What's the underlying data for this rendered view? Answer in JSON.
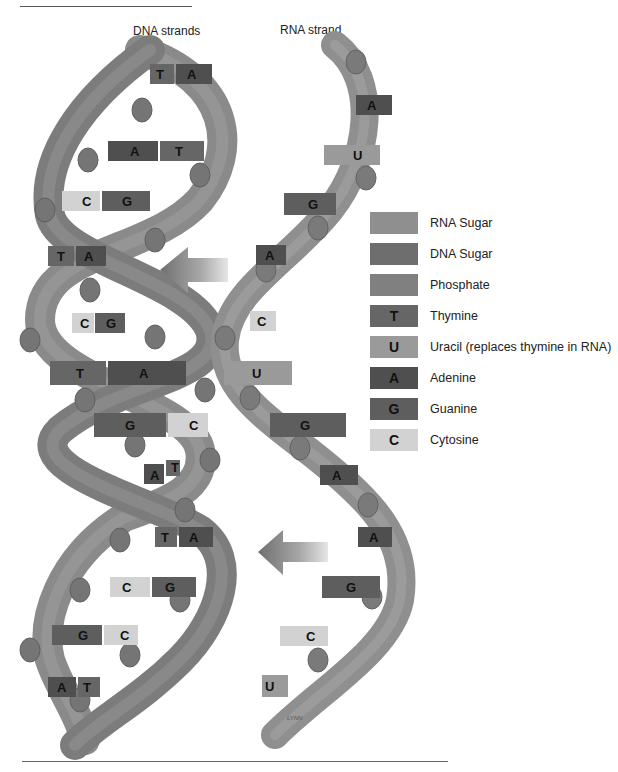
{
  "page": {
    "headings": {
      "dna": "DNA strands",
      "rna": "RNA strand"
    },
    "credit": "LYNN"
  },
  "colors": {
    "rna_sugar": "#8f8f8f",
    "dna_sugar": "#6e6e6e",
    "phosphate": "#7f7f7f",
    "thymine": "#666666",
    "uracil": "#9a9a9a",
    "adenine": "#4f4f4f",
    "guanine": "#5e5e5e",
    "cytosine": "#cfcfcf",
    "backbone": "#8a8a8a",
    "joint": "#777777"
  },
  "legend": [
    {
      "symbol": "",
      "label": "RNA Sugar",
      "color": "#8f8f8f"
    },
    {
      "symbol": "",
      "label": "DNA Sugar",
      "color": "#6e6e6e"
    },
    {
      "symbol": "",
      "label": "Phosphate",
      "color": "#808080"
    },
    {
      "symbol": "T",
      "label": "Thymine",
      "color": "#666666"
    },
    {
      "symbol": "U",
      "label": "Uracil (replaces thymine in RNA)",
      "color": "#9a9a9a"
    },
    {
      "symbol": "A",
      "label": "Adenine",
      "color": "#4f4f4f"
    },
    {
      "symbol": "G",
      "label": "Guanine",
      "color": "#5e5e5e"
    },
    {
      "symbol": "C",
      "label": "Cytosine",
      "color": "#d2d2d2"
    }
  ],
  "dna_pairs": [
    {
      "left": "T",
      "right": "A"
    },
    {
      "left": "A",
      "right": "T"
    },
    {
      "left": "C",
      "right": "G"
    },
    {
      "left": "T",
      "right": "A"
    },
    {
      "left": "C",
      "right": "G"
    },
    {
      "left": "T",
      "right": "A"
    },
    {
      "left": "G",
      "right": "C"
    },
    {
      "left": "A",
      "right": "T"
    },
    {
      "left": "T",
      "right": "A"
    },
    {
      "left": "C",
      "right": "G"
    },
    {
      "left": "G",
      "right": "C"
    },
    {
      "left": "A",
      "right": "T"
    }
  ],
  "rna_bases": [
    "A",
    "U",
    "G",
    "A",
    "C",
    "U",
    "G",
    "A",
    "A",
    "G",
    "C",
    "U"
  ],
  "arrows": [
    {
      "direction": "left",
      "meaning": "transcription"
    },
    {
      "direction": "left",
      "meaning": "transcription"
    }
  ]
}
